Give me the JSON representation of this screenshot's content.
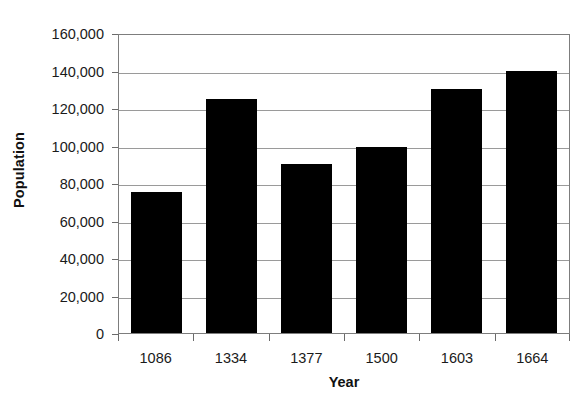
{
  "chart_data": {
    "type": "bar",
    "title": "",
    "subtitle": "",
    "xlabel": "Year",
    "ylabel": "Population",
    "categories": [
      "1086",
      "1334",
      "1377",
      "1500",
      "1603",
      "1664"
    ],
    "values": [
      75000,
      125000,
      90000,
      99000,
      130000,
      140000
    ],
    "series": [
      {
        "name": "Population",
        "values": [
          75000,
          125000,
          90000,
          99000,
          130000,
          140000
        ],
        "color": "#000000"
      }
    ],
    "ylim": [
      0,
      160000
    ],
    "ytick_values": [
      160000,
      140000,
      120000,
      100000,
      80000,
      60000,
      40000,
      20000,
      0
    ],
    "ytick_labels": [
      "160,000",
      "140,000",
      "120,000",
      "100,000",
      "80,000",
      "60,000",
      "40,000",
      "20,000",
      "0"
    ],
    "grid": "horizontal",
    "legend": "none",
    "bar_color": "#000000",
    "plot_border_color": "#7d7d7d",
    "gridline_color": "#9a9a9a",
    "background": "#ffffff",
    "annotations": []
  }
}
